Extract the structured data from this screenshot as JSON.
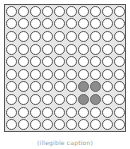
{
  "grid": {
    "rows": 10,
    "cols": 10,
    "filled_cells": [
      [
        6,
        6
      ],
      [
        6,
        7
      ],
      [
        7,
        6
      ],
      [
        7,
        7
      ]
    ],
    "colors": {
      "empty_fill": "#ffffff",
      "filled_fill": "#8c8c8c",
      "outline": "#555555",
      "background": "#e6e6e6"
    }
  },
  "caption": "(illegible caption)"
}
